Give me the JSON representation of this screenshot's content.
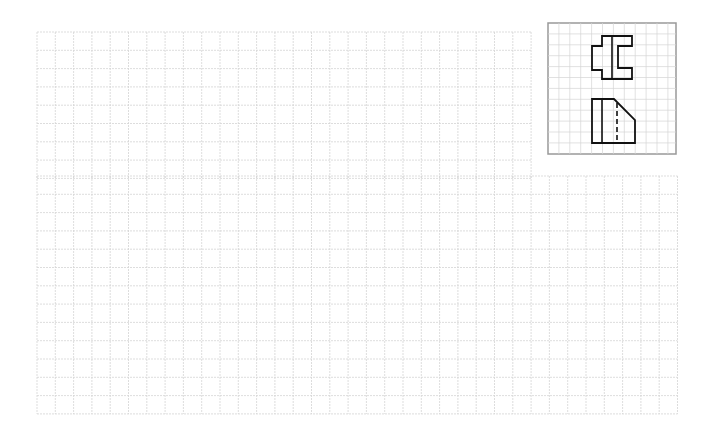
{
  "page": {
    "background": "#ffffff",
    "grid_color": "#d4d4d4",
    "grid_stroke_dasharray": "2 1"
  },
  "drawing_grid": {
    "cell_size": 18.3,
    "upper_region": {
      "x": 37,
      "y": 32,
      "cols": 27,
      "rows": 8
    },
    "lower_region": {
      "x": 37,
      "y": 176,
      "cols": 35,
      "rows": 13
    }
  },
  "reference_box": {
    "x": 548,
    "y": 23,
    "width": 128,
    "height": 131,
    "border_color": "#999999",
    "grid_cell": 10.9,
    "shape_stroke": "#111111",
    "top_view": {
      "outline": [
        [
          602,
          36
        ],
        [
          632,
          36
        ],
        [
          632,
          46
        ],
        [
          618,
          46
        ],
        [
          618,
          68
        ],
        [
          632,
          68
        ],
        [
          632,
          79
        ],
        [
          602,
          79
        ],
        [
          602,
          70
        ],
        [
          592,
          70
        ],
        [
          592,
          46
        ],
        [
          602,
          46
        ]
      ],
      "inner_line": [
        [
          612,
          36
        ],
        [
          612,
          79
        ]
      ]
    },
    "front_view": {
      "outline": [
        [
          592,
          99
        ],
        [
          614,
          99
        ],
        [
          635,
          120
        ],
        [
          635,
          143
        ],
        [
          592,
          143
        ]
      ],
      "inner_line": [
        [
          602,
          99
        ],
        [
          602,
          143
        ]
      ],
      "hidden_line": [
        [
          617,
          103
        ],
        [
          617,
          143
        ]
      ]
    }
  }
}
